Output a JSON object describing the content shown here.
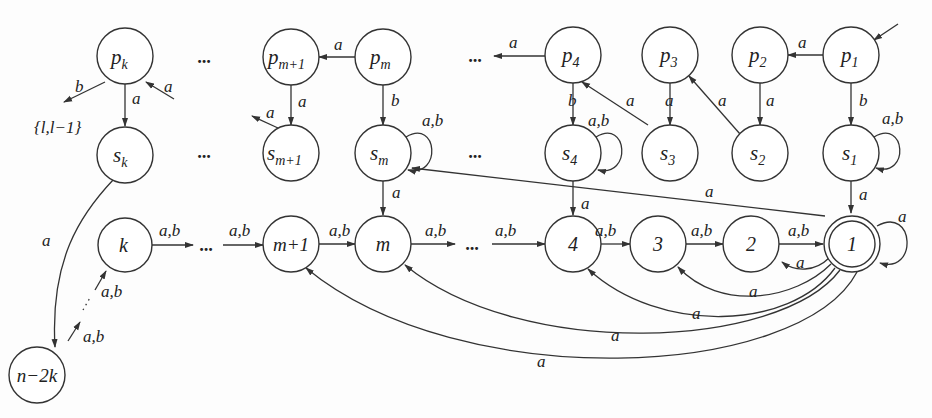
{
  "diagram": {
    "type": "finite automaton",
    "colors": {
      "stroke": "#333333",
      "background": "#fdfdfd",
      "text": "#222222"
    },
    "nodes": [
      {
        "id": "pk",
        "label": "p",
        "sub": "k",
        "x": 125,
        "y": 56
      },
      {
        "id": "sk",
        "label": "s",
        "sub": "k",
        "x": 125,
        "y": 155
      },
      {
        "id": "k",
        "label": "k",
        "sub": "",
        "x": 125,
        "y": 245
      },
      {
        "id": "n2k",
        "label": "n−2k",
        "sub": "",
        "x": 37,
        "y": 375
      },
      {
        "id": "pm1",
        "label": "p",
        "sub": "m+1",
        "x": 291,
        "y": 57
      },
      {
        "id": "sm1",
        "label": "s",
        "sub": "m+1",
        "x": 291,
        "y": 153
      },
      {
        "id": "pm",
        "label": "p",
        "sub": "m",
        "x": 383,
        "y": 57
      },
      {
        "id": "sm",
        "label": "s",
        "sub": "m",
        "x": 383,
        "y": 153
      },
      {
        "id": "p4",
        "label": "p",
        "sub": "4",
        "x": 573,
        "y": 55
      },
      {
        "id": "s4",
        "label": "s",
        "sub": "4",
        "x": 573,
        "y": 153
      },
      {
        "id": "p3",
        "label": "p",
        "sub": "3",
        "x": 670,
        "y": 55
      },
      {
        "id": "s3",
        "label": "s",
        "sub": "3",
        "x": 670,
        "y": 153
      },
      {
        "id": "p2",
        "label": "p",
        "sub": "2",
        "x": 760,
        "y": 55
      },
      {
        "id": "s2",
        "label": "s",
        "sub": "2",
        "x": 760,
        "y": 153
      },
      {
        "id": "p1",
        "label": "p",
        "sub": "1",
        "x": 851,
        "y": 55
      },
      {
        "id": "s1",
        "label": "s",
        "sub": "1",
        "x": 851,
        "y": 153
      },
      {
        "id": "m1",
        "label": "m+1",
        "sub": "",
        "x": 291,
        "y": 244
      },
      {
        "id": "m",
        "label": "m",
        "sub": "",
        "x": 383,
        "y": 244
      },
      {
        "id": "n4",
        "label": "4",
        "sub": "",
        "x": 573,
        "y": 244
      },
      {
        "id": "n3",
        "label": "3",
        "sub": "",
        "x": 658,
        "y": 244
      },
      {
        "id": "n2",
        "label": "2",
        "sub": "",
        "x": 751,
        "y": 244
      },
      {
        "id": "n1",
        "label": "1",
        "sub": "",
        "x": 852,
        "y": 244,
        "accepting": true
      }
    ],
    "ellipses": [
      "...",
      "...",
      "...",
      "...",
      "...",
      "...",
      "..."
    ],
    "edge_labels": {
      "a": "a",
      "b": "b",
      "ab": "a,b",
      "set": "{l,l−1}"
    },
    "edges": [
      {
        "from": "start",
        "to": "p1",
        "label": ""
      },
      {
        "from": "p1",
        "to": "p2",
        "label": "a"
      },
      {
        "from": "p1",
        "to": "s1",
        "label": "b"
      },
      {
        "from": "s1",
        "to": "s1",
        "label": "a,b"
      },
      {
        "from": "s1",
        "to": "1",
        "label": "a"
      },
      {
        "from": "p2",
        "to": "s2",
        "label": "a"
      },
      {
        "from": "s2",
        "to": "p3",
        "label": "a"
      },
      {
        "from": "p3",
        "to": "s3",
        "label": "a"
      },
      {
        "from": "s3",
        "to": "p4",
        "label": "a"
      },
      {
        "from": "p4",
        "to": "...",
        "label": "a"
      },
      {
        "from": "p4",
        "to": "s4",
        "label": "b"
      },
      {
        "from": "s4",
        "to": "s4",
        "label": "a,b"
      },
      {
        "from": "s4",
        "to": "4",
        "label": "a"
      },
      {
        "from": "pm",
        "to": "pm+1",
        "label": "a"
      },
      {
        "from": "pm",
        "to": "sm",
        "label": "b"
      },
      {
        "from": "sm",
        "to": "sm",
        "label": "a,b"
      },
      {
        "from": "sm",
        "to": "m",
        "label": "a"
      },
      {
        "from": "1",
        "to": "sm",
        "label": "a"
      },
      {
        "from": "pm+1",
        "to": "sm+1",
        "label": "a"
      },
      {
        "from": "sm+1",
        "to": "...",
        "label": "a"
      },
      {
        "from": "...",
        "to": "pk",
        "label": "a"
      },
      {
        "from": "pk",
        "to": "sk",
        "label": "a"
      },
      {
        "from": "pk",
        "to": "{l,l-1}",
        "label": "b"
      },
      {
        "from": "sk",
        "to": "n-2k",
        "label": "a"
      },
      {
        "from": "n-2k",
        "to": "...",
        "label": "a,b"
      },
      {
        "from": "...",
        "to": "k",
        "label": "a,b"
      },
      {
        "from": "k",
        "to": "...",
        "label": "a,b"
      },
      {
        "from": "...",
        "to": "m+1",
        "label": "a,b"
      },
      {
        "from": "m+1",
        "to": "m",
        "label": "a,b"
      },
      {
        "from": "m",
        "to": "...",
        "label": "a,b"
      },
      {
        "from": "...",
        "to": "4",
        "label": "a,b"
      },
      {
        "from": "4",
        "to": "3",
        "label": "a,b"
      },
      {
        "from": "3",
        "to": "2",
        "label": "a,b"
      },
      {
        "from": "2",
        "to": "1",
        "label": "a,b"
      },
      {
        "from": "1",
        "to": "1",
        "label": "a"
      },
      {
        "from": "1",
        "to": "2",
        "label": "a"
      },
      {
        "from": "1",
        "to": "3",
        "label": "a"
      },
      {
        "from": "1",
        "to": "4",
        "label": "a"
      },
      {
        "from": "1",
        "to": "m",
        "label": "a"
      },
      {
        "from": "1",
        "to": "m+1",
        "label": "a"
      }
    ]
  }
}
